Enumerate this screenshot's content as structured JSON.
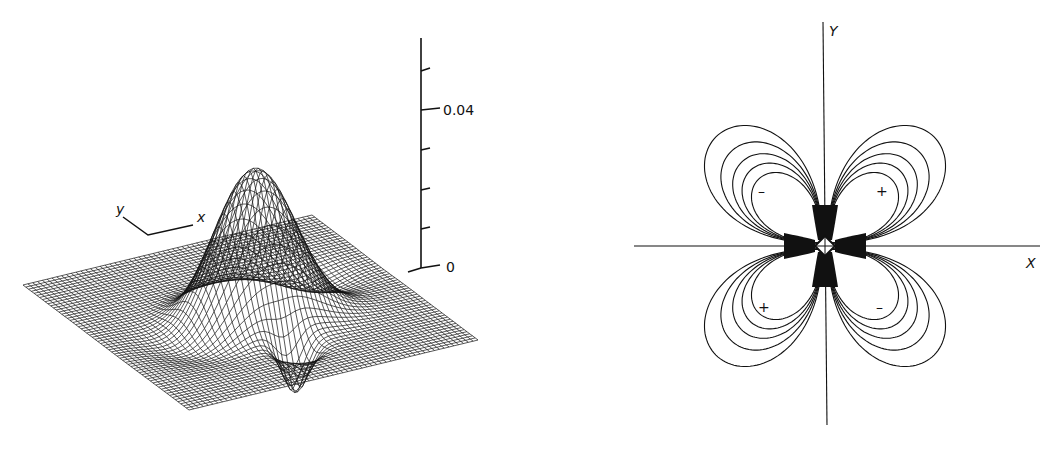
{
  "figure": {
    "left_panel": {
      "description": "3D wireframe surface plot of a function with a central peak and side dips",
      "z_axis": {
        "ticks": [
          "",
          "",
          "",
          "",
          "",
          ""
        ],
        "tick_labels": {
          "0": "0",
          "0.04": "0.04"
        },
        "label_top": "0.04",
        "label_bottom": "0"
      },
      "orientation_axes": {
        "y_label": "y",
        "x_label": "x"
      }
    },
    "right_panel": {
      "description": "Contour plot with four lobes arranged in a cloverleaf",
      "x_axis_label": "X",
      "y_axis_label": "Y",
      "quadrant_signs": {
        "upper_left": "–",
        "upper_right": "+",
        "lower_left": "+",
        "lower_right": "–"
      }
    }
  },
  "style": {
    "ink": "#111111",
    "paper": "#ffffff"
  }
}
